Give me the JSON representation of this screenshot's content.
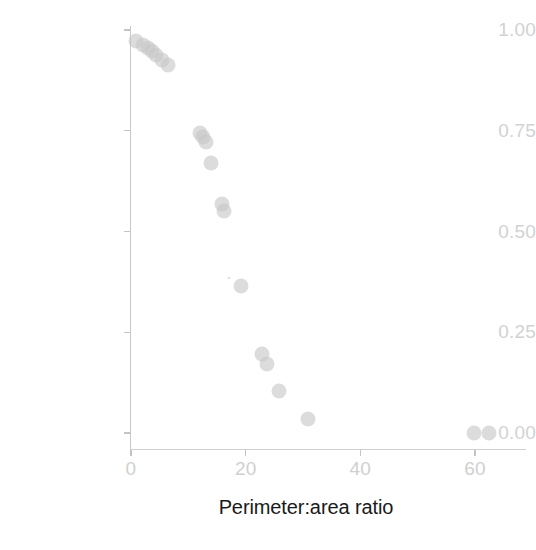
{
  "chart_data": {
    "type": "scatter",
    "title": "",
    "xlabel": "Perimeter:area ratio",
    "ylabel": "Probability (lizards present)",
    "xlim": [
      -2,
      66
    ],
    "ylim": [
      -0.03,
      1.02
    ],
    "xticks": [
      0,
      20,
      40,
      60
    ],
    "xticklabels": [
      "0",
      "20",
      "40",
      "60"
    ],
    "yticks": [
      0.0,
      0.25,
      0.5,
      0.75,
      1.0
    ],
    "yticklabels": [
      "0.00",
      "0.25",
      "0.50",
      "0.75",
      "1.00"
    ],
    "grid": false,
    "legend": null,
    "marker": {
      "shape": "circle",
      "color": "#c6c6c6",
      "opacity": 0.62,
      "size_px": 15
    },
    "series": [
      {
        "name": "observations",
        "points": [
          {
            "x": 0.9,
            "y": 0.972
          },
          {
            "x": 2.1,
            "y": 0.963
          },
          {
            "x": 2.9,
            "y": 0.955
          },
          {
            "x": 3.6,
            "y": 0.948
          },
          {
            "x": 4.4,
            "y": 0.938
          },
          {
            "x": 5.4,
            "y": 0.925
          },
          {
            "x": 6.4,
            "y": 0.912
          },
          {
            "x": 12.0,
            "y": 0.745
          },
          {
            "x": 12.6,
            "y": 0.735
          },
          {
            "x": 13.1,
            "y": 0.722
          },
          {
            "x": 14.0,
            "y": 0.67
          },
          {
            "x": 15.9,
            "y": 0.567
          },
          {
            "x": 16.2,
            "y": 0.55
          },
          {
            "x": 19.2,
            "y": 0.365
          },
          {
            "x": 22.9,
            "y": 0.195
          },
          {
            "x": 23.7,
            "y": 0.17
          },
          {
            "x": 25.9,
            "y": 0.105
          },
          {
            "x": 30.9,
            "y": 0.035
          },
          {
            "x": 59.8,
            "y": 0.0
          },
          {
            "x": 62.5,
            "y": 0.0
          }
        ]
      }
    ]
  },
  "axes": {
    "y_title": "Probability (lizards present)",
    "x_title": "Perimeter:area ratio",
    "y_tick_labels": [
      "1.00",
      "0.75",
      "0.50",
      "0.25",
      "0.00"
    ],
    "x_tick_labels": [
      "0",
      "20",
      "40",
      "60"
    ]
  },
  "colors": {
    "marker": "#c6c6c6",
    "axis_line": "#c9c9c9",
    "tick_label": "#d1d1d1",
    "axis_title": "#1a1a1a",
    "background": "#ffffff"
  }
}
